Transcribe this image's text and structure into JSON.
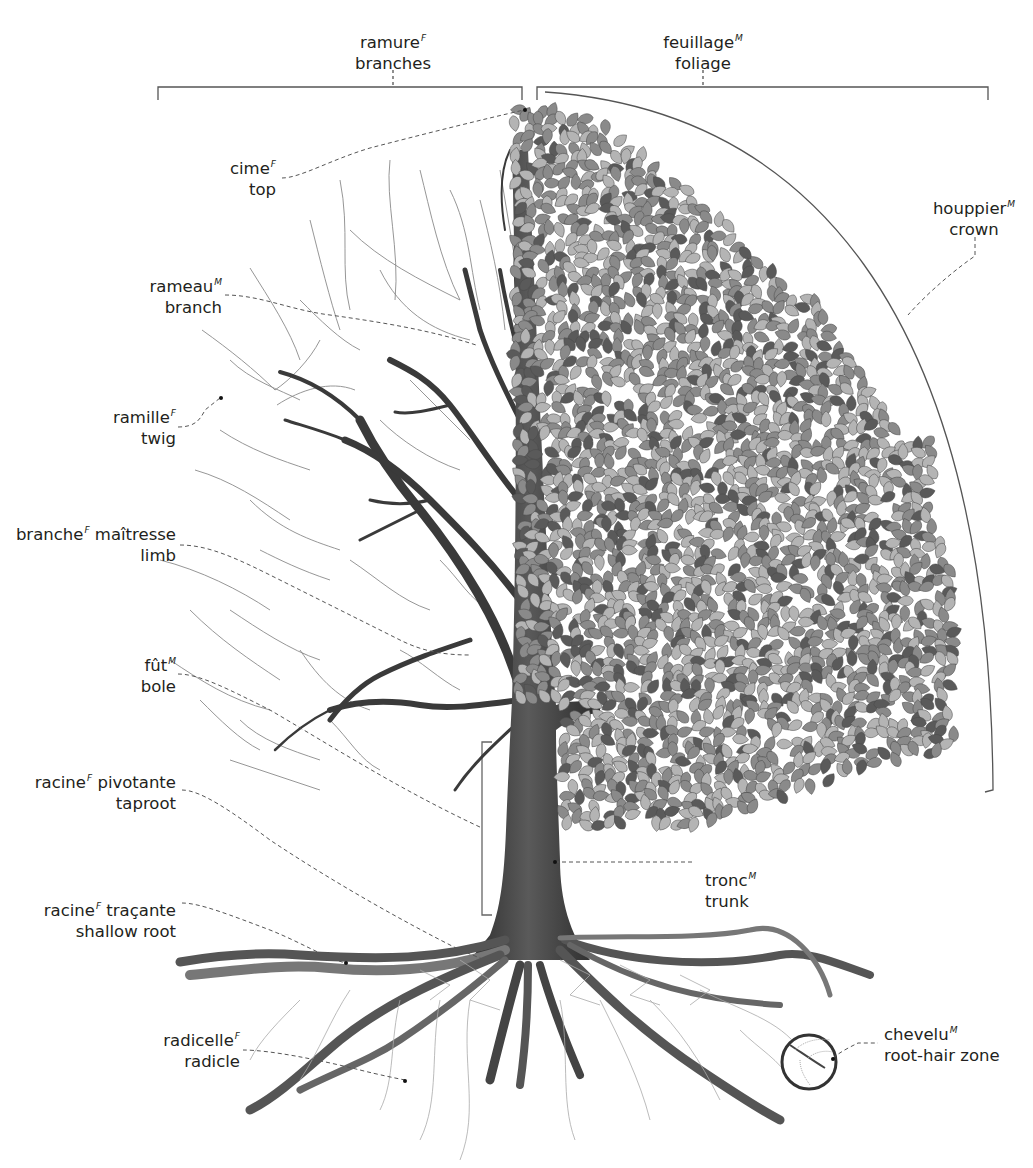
{
  "diagram": {
    "colors": {
      "background": "#ffffff",
      "text": "#231f20",
      "leader_line": "#555555",
      "bracket": "#555555",
      "bark": "#3a3a3a",
      "leaf_light": "#b4b4b4",
      "leaf_mid": "#8a8a8a",
      "leaf_dark": "#5a5a5a"
    },
    "labels": [
      {
        "id": "ramure",
        "fr": "ramure",
        "gender": "F",
        "en": "branches"
      },
      {
        "id": "feuillage",
        "fr": "feuillage",
        "gender": "M",
        "en": "foliage"
      },
      {
        "id": "cime",
        "fr": "cime",
        "gender": "F",
        "en": "top"
      },
      {
        "id": "houppier",
        "fr": "houppier",
        "gender": "M",
        "en": "crown"
      },
      {
        "id": "rameau",
        "fr": "rameau",
        "gender": "M",
        "en": "branch"
      },
      {
        "id": "ramille",
        "fr": "ramille",
        "gender": "F",
        "en": "twig"
      },
      {
        "id": "branche-maitresse",
        "fr": "branche",
        "gender": "F",
        "fr_suffix": " maîtresse",
        "en": "limb"
      },
      {
        "id": "fut",
        "fr": "fût",
        "gender": "M",
        "en": "bole"
      },
      {
        "id": "racine-pivotante",
        "fr": "racine",
        "gender": "F",
        "fr_suffix": " pivotante",
        "en": "taproot"
      },
      {
        "id": "tronc",
        "fr": "tronc",
        "gender": "M",
        "en": "trunk"
      },
      {
        "id": "racine-tracante",
        "fr": "racine",
        "gender": "F",
        "fr_suffix": " traçante",
        "en": "shallow root"
      },
      {
        "id": "chevelu",
        "fr": "chevelu",
        "gender": "M",
        "en": "root-hair zone"
      },
      {
        "id": "radicelle",
        "fr": "radicelle",
        "gender": "F",
        "en": "radicle"
      }
    ]
  }
}
